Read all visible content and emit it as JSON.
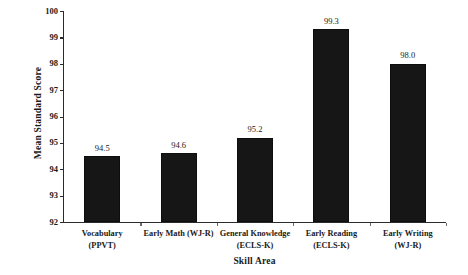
{
  "chart_data": {
    "type": "bar",
    "title": "",
    "xlabel": "Skill Area",
    "ylabel": "Mean Standard Score",
    "ylim": [
      92,
      100
    ],
    "yticks": [
      "100",
      "99",
      "98",
      "97",
      "96",
      "95",
      "94",
      "93",
      "92"
    ],
    "grid": false,
    "legend": null,
    "bar_color": "#161616",
    "categories": [
      {
        "line1": "Vocabulary",
        "line2": "(PPVT)"
      },
      {
        "line1": "Early Math (WJ-R)",
        "line2": ""
      },
      {
        "line1": "General Knowledge",
        "line2": "(ECLS-K)"
      },
      {
        "line1": "Early Reading",
        "line2": "(ECLS-K)"
      },
      {
        "line1": "Early Writing",
        "line2": "(WJ-R)"
      }
    ],
    "values": [
      94.5,
      94.6,
      95.2,
      99.3,
      98.0
    ],
    "value_labels": [
      "94.5",
      "94.6",
      "95.2",
      "99.3",
      "98.0"
    ]
  }
}
